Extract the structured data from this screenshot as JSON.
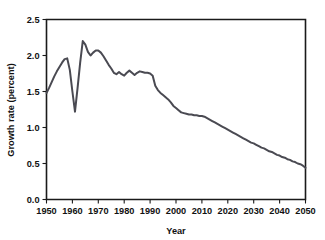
{
  "chart_data": {
    "type": "line",
    "title": "",
    "xlabel": "Year",
    "ylabel": "Growth rate (percent)",
    "xlim": [
      1950,
      2050
    ],
    "ylim": [
      0.0,
      2.5
    ],
    "grid": false,
    "legend": null,
    "xticks": [
      1950,
      1960,
      1970,
      1980,
      1990,
      2000,
      2010,
      2020,
      2030,
      2040,
      2050
    ],
    "xtick_labels": [
      "1950",
      "1960",
      "1970",
      "1980",
      "1990",
      "2000",
      "2010",
      "2020",
      "2030",
      "2040",
      "2050"
    ],
    "yticks": [
      0.0,
      0.5,
      1.0,
      1.5,
      2.0,
      2.5
    ],
    "ytick_labels": [
      "0.0",
      "0.5",
      "1.0",
      "1.5",
      "2.0",
      "2.5"
    ],
    "line_color": "#4a4a52",
    "series": [
      {
        "name": "World population growth rate",
        "x": [
          1950,
          1951,
          1952,
          1953,
          1954,
          1955,
          1956,
          1957,
          1958,
          1959,
          1960,
          1961,
          1962,
          1963,
          1964,
          1965,
          1966,
          1967,
          1968,
          1969,
          1970,
          1971,
          1972,
          1973,
          1974,
          1975,
          1976,
          1977,
          1978,
          1979,
          1980,
          1981,
          1982,
          1983,
          1984,
          1985,
          1986,
          1987,
          1988,
          1989,
          1990,
          1991,
          1992,
          1993,
          1994,
          1995,
          1996,
          1997,
          1998,
          1999,
          2000,
          2001,
          2002,
          2003,
          2004,
          2005,
          2006,
          2007,
          2008,
          2009,
          2010,
          2011,
          2012,
          2013,
          2014,
          2015,
          2016,
          2017,
          2018,
          2019,
          2020,
          2021,
          2022,
          2023,
          2024,
          2025,
          2026,
          2027,
          2028,
          2029,
          2030,
          2031,
          2032,
          2033,
          2034,
          2035,
          2036,
          2037,
          2038,
          2039,
          2040,
          2041,
          2042,
          2043,
          2044,
          2045,
          2046,
          2047,
          2048,
          2049,
          2050
        ],
        "y": [
          1.48,
          1.55,
          1.63,
          1.71,
          1.78,
          1.84,
          1.9,
          1.95,
          1.96,
          1.8,
          1.5,
          1.22,
          1.55,
          1.9,
          2.2,
          2.15,
          2.05,
          2.0,
          2.04,
          2.07,
          2.07,
          2.04,
          1.99,
          1.93,
          1.87,
          1.82,
          1.76,
          1.74,
          1.77,
          1.74,
          1.72,
          1.76,
          1.79,
          1.76,
          1.73,
          1.76,
          1.78,
          1.77,
          1.76,
          1.76,
          1.75,
          1.72,
          1.58,
          1.52,
          1.48,
          1.45,
          1.42,
          1.39,
          1.35,
          1.3,
          1.27,
          1.24,
          1.21,
          1.2,
          1.19,
          1.18,
          1.18,
          1.17,
          1.17,
          1.16,
          1.16,
          1.15,
          1.13,
          1.11,
          1.09,
          1.07,
          1.05,
          1.03,
          1.01,
          0.99,
          0.97,
          0.95,
          0.93,
          0.91,
          0.89,
          0.87,
          0.85,
          0.83,
          0.81,
          0.79,
          0.78,
          0.76,
          0.74,
          0.72,
          0.71,
          0.69,
          0.67,
          0.66,
          0.64,
          0.62,
          0.61,
          0.59,
          0.58,
          0.56,
          0.55,
          0.53,
          0.52,
          0.5,
          0.49,
          0.47,
          0.44
        ]
      }
    ]
  }
}
